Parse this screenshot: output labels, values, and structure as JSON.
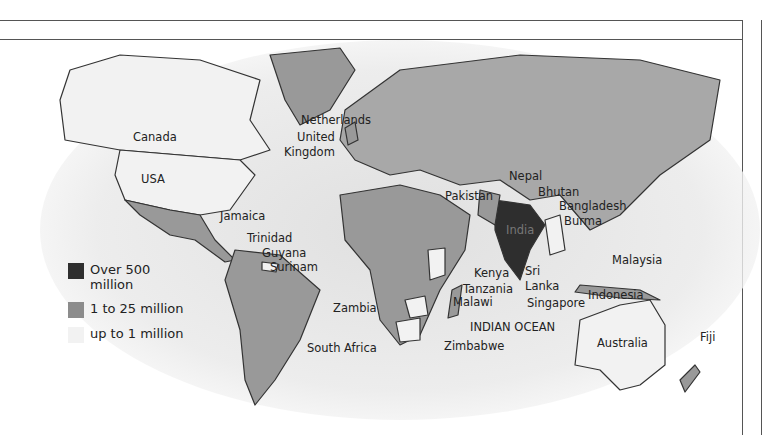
{
  "legend": {
    "items": [
      {
        "label_line1": "Over 500",
        "label_line2": "million",
        "color": "#2e2e2e"
      },
      {
        "label_line1": "1 to 25 million",
        "label_line2": "",
        "color": "#8c8c8c"
      },
      {
        "label_line1": "up to 1 million",
        "label_line2": "",
        "color": "#f2f2f2"
      }
    ]
  },
  "labels": {
    "canada": "Canada",
    "usa": "USA",
    "netherlands": "Netherlands",
    "united": "United",
    "kingdom": "Kingdom",
    "jamaica": "Jamaica",
    "trinidad": "Trinidad",
    "guyana": "Guyana",
    "surinam": "Surinam",
    "nepal": "Nepal",
    "bhutan": "Bhutan",
    "pakistan": "Pakistan",
    "bangladesh": "Bangladesh",
    "burma": "Burma",
    "india": "India",
    "kenya": "Kenya",
    "tanzania": "Tanzania",
    "malawi": "Malawi",
    "zambia": "Zambia",
    "south_africa": "South Africa",
    "zimbabwe": "Zimbabwe",
    "indian_ocean": "INDIAN OCEAN",
    "sri": "Sri",
    "lanka": "Lanka",
    "singapore": "Singapore",
    "indonesia": "Indonesia",
    "malaysia": "Malaysia",
    "australia": "Australia",
    "fiji": "Fiji"
  },
  "border": {
    "ornament_a": "⟩●⟨",
    "ornament_b": "•●•"
  }
}
